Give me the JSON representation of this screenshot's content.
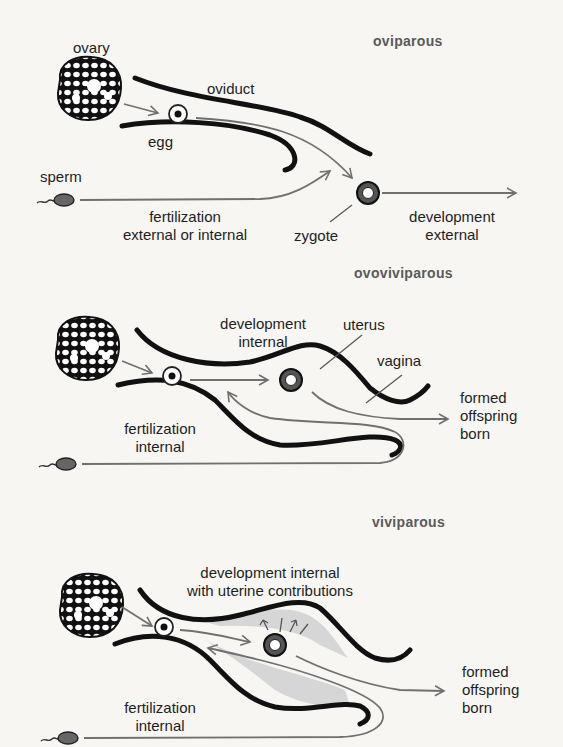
{
  "panels": [
    {
      "title": "oviparous",
      "labels": {
        "ovary": "ovary",
        "oviduct": "oviduct",
        "egg": "egg",
        "sperm": "sperm",
        "fertilization_line1": "fertilization",
        "fertilization_line2": "external or internal",
        "zygote": "zygote",
        "development_line1": "development",
        "development_line2": "external"
      }
    },
    {
      "title": "ovoviviparous",
      "labels": {
        "development_line1": "development",
        "development_line2": "internal",
        "uterus": "uterus",
        "vagina": "vagina",
        "fertilization_line1": "fertilization",
        "fertilization_line2": "internal",
        "outcome_line1": "formed",
        "outcome_line2": "offspring",
        "outcome_line3": "born"
      }
    },
    {
      "title": "viviparous",
      "labels": {
        "development_line1": "development internal",
        "development_line2": "with uterine contributions",
        "fertilization_line1": "fertilization",
        "fertilization_line2": "internal",
        "outcome_line1": "formed",
        "outcome_line2": "offspring",
        "outcome_line3": "born"
      }
    }
  ],
  "colors": {
    "background": "#f7f6f3",
    "duct": "#111111",
    "arrow": "#707070",
    "uterine_tissue": "#d6d6d6",
    "title": "#5a5a5a"
  }
}
